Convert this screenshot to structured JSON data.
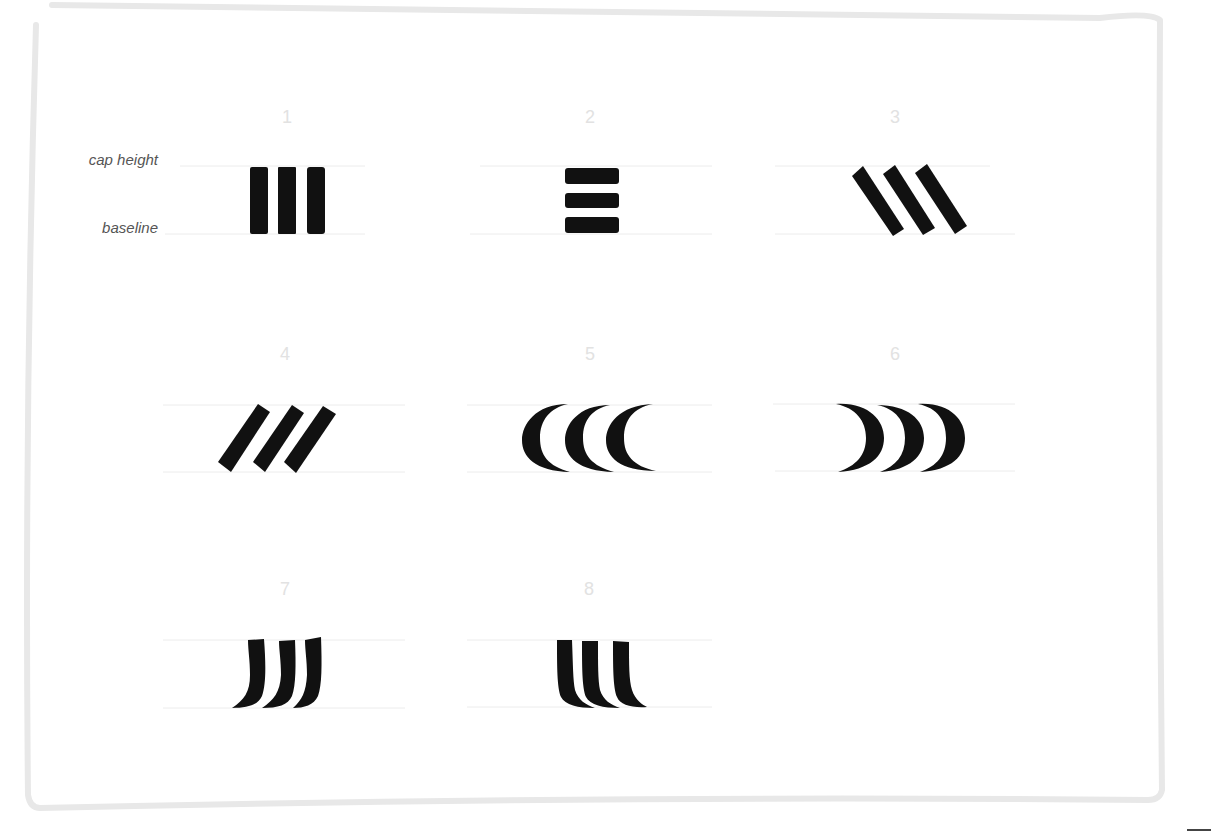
{
  "labels": {
    "cap_height": "cap height",
    "baseline": "baseline"
  },
  "colors": {
    "ink": "#111111",
    "frame": "#e8e8e8",
    "guide": "#ececec",
    "number": "#e2e2e2",
    "label": "#555555"
  },
  "figures": [
    {
      "number": "1",
      "description": "three vertical bars"
    },
    {
      "number": "2",
      "description": "three horizontal bars"
    },
    {
      "number": "3",
      "description": "three backslash-slanted bars"
    },
    {
      "number": "4",
      "description": "three forward-slanted bars"
    },
    {
      "number": "5",
      "description": "three left-opening crescents"
    },
    {
      "number": "6",
      "description": "three right-opening crescents"
    },
    {
      "number": "7",
      "description": "three strokes curving left at baseline"
    },
    {
      "number": "8",
      "description": "three strokes curving right at baseline"
    }
  ]
}
